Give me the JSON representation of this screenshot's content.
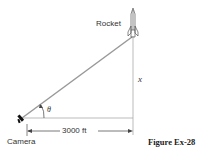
{
  "labels": {
    "rocket": "Rocket",
    "camera": "Camera",
    "height_var": "x",
    "angle_var": "θ",
    "distance": "3000 ft",
    "caption": "Figure Ex-28"
  },
  "colors": {
    "line": "#888888",
    "sight_line": "#999999",
    "text": "#333333"
  }
}
